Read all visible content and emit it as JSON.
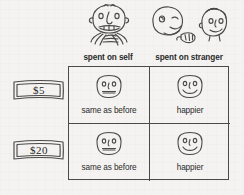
{
  "figure": {
    "columns": [
      {
        "key": "self",
        "label": "spent on self",
        "icon": "face-eating-icon"
      },
      {
        "key": "stranger",
        "label": "spent on stranger",
        "icon": "face-giving-to-stranger-icon"
      }
    ],
    "rows": [
      {
        "key": "five",
        "amount_label": "$5",
        "icon": "banknote-icon"
      },
      {
        "key": "twenty",
        "amount_label": "$20",
        "icon": "banknote-icon"
      }
    ],
    "cells": [
      {
        "row": "five",
        "column": "self",
        "outcome_label": "same as before",
        "face": "neutral-face-icon"
      },
      {
        "row": "five",
        "column": "stranger",
        "outcome_label": "happier",
        "face": "happy-face-icon"
      },
      {
        "row": "twenty",
        "column": "self",
        "outcome_label": "same as before",
        "face": "neutral-face-icon"
      },
      {
        "row": "twenty",
        "column": "stranger",
        "outcome_label": "happier",
        "face": "happy-face-icon"
      }
    ],
    "colors": {
      "background": "#f4f3f1",
      "ink": "#4a4a4a",
      "text": "#2a2a2a"
    }
  }
}
